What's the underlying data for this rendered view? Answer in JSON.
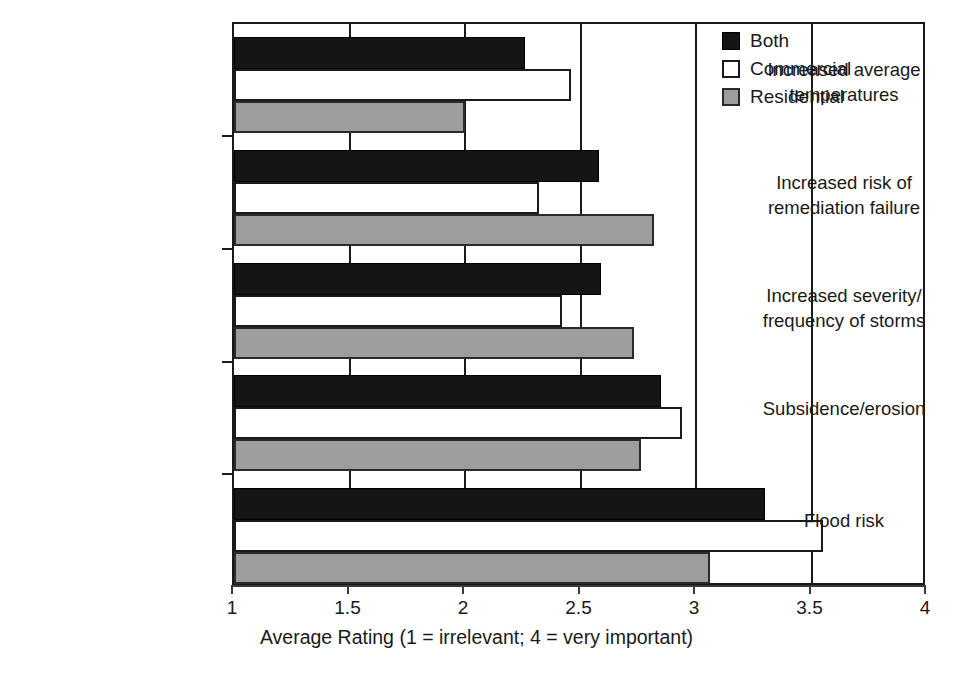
{
  "chart_data": {
    "type": "bar",
    "orientation": "horizontal",
    "title": "",
    "xlabel": "Average Rating (1 = irrelevant; 4 = very important)",
    "ylabel": "",
    "xlim": [
      1,
      4
    ],
    "xticks": [
      1,
      1.5,
      2,
      2.5,
      3,
      3.5,
      4
    ],
    "xtick_labels": [
      "1",
      "1.5",
      "2",
      "2.5",
      "3",
      "3.5",
      "4"
    ],
    "grid": "vertical",
    "legend_position": "top-right",
    "categories": [
      "Increased average\ntemperatures",
      "Increased risk of\nremediation failure",
      "Increased severity/\nfrequency of storms",
      "Subsidence/erosion",
      "Flood risk"
    ],
    "series": [
      {
        "name": "Both",
        "color": "#151515",
        "values": [
          2.26,
          2.58,
          2.59,
          2.85,
          3.3
        ]
      },
      {
        "name": "Commercial",
        "color": "#ffffff",
        "values": [
          2.46,
          2.32,
          2.42,
          2.94,
          3.55
        ]
      },
      {
        "name": "Residential",
        "color": "#9d9d9d",
        "values": [
          2.0,
          2.82,
          2.73,
          2.76,
          3.06
        ]
      }
    ]
  },
  "legend": {
    "items": [
      {
        "label": "Both",
        "swatch": "black-filled-square"
      },
      {
        "label": "Commercial",
        "swatch": "white-outlined-square"
      },
      {
        "label": "Residential",
        "swatch": "gray-filled-square"
      }
    ]
  },
  "axis": {
    "x_title": "Average Rating (1 = irrelevant; 4 = very important)",
    "tick_labels": [
      "1",
      "1.5",
      "2",
      "2.5",
      "3",
      "3.5",
      "4"
    ]
  }
}
